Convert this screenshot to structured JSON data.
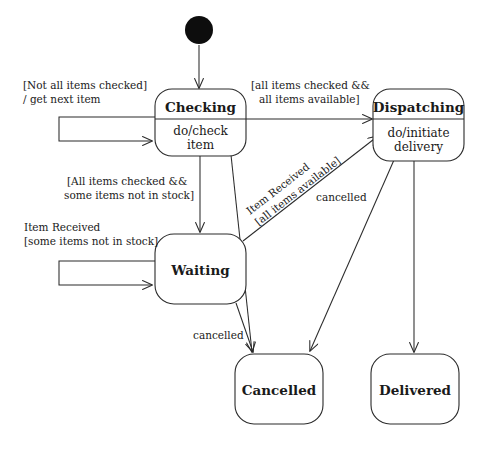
{
  "diagram": {
    "kind": "uml-state-machine-diagram",
    "canvas": {
      "width": 488,
      "height": 450
    },
    "states": {
      "initial": {
        "name": "initial-pseudostate",
        "label": ""
      },
      "checking": {
        "name": "Checking",
        "activity_line1": "do/check",
        "activity_line2": "item"
      },
      "dispatching": {
        "name": "Dispatching",
        "activity_line1": "do/initiate",
        "activity_line2": "delivery"
      },
      "waiting": {
        "name": "Waiting",
        "activity_line1": "",
        "activity_line2": ""
      },
      "cancelled": {
        "name": "Cancelled",
        "activity_line1": "",
        "activity_line2": ""
      },
      "delivered": {
        "name": "Delivered",
        "activity_line1": "",
        "activity_line2": ""
      }
    },
    "transitions": {
      "checking_self": {
        "line1": "[Not all items checked]",
        "line2": "/ get next item",
        "from": "Checking",
        "to": "Checking"
      },
      "checking_to_dispatching": {
        "line1": "[all items checked &&",
        "line2": "all items available]",
        "from": "Checking",
        "to": "Dispatching"
      },
      "checking_to_waiting": {
        "line1": "[All items checked &&",
        "line2": "some items not in stock]",
        "from": "Checking",
        "to": "Waiting"
      },
      "waiting_self": {
        "line1": "Item Received",
        "line2": "[some items not in stock]",
        "from": "Waiting",
        "to": "Waiting"
      },
      "waiting_to_dispatching": {
        "line1": "Item Received",
        "line2": "[all items available]",
        "from": "Waiting",
        "to": "Dispatching"
      },
      "dispatching_to_cancelled": {
        "line1": "cancelled",
        "from": "Dispatching",
        "to": "Cancelled"
      },
      "waiting_to_cancelled": {
        "line1": "cancelled",
        "from": "Waiting",
        "to": "Cancelled"
      },
      "checking_to_cancelled": {
        "line1": "",
        "from": "Checking",
        "to": "Cancelled"
      },
      "dispatching_to_delivered": {
        "line1": "",
        "from": "Dispatching",
        "to": "Delivered"
      },
      "initial_to_checking": {
        "line1": "",
        "from": "initial",
        "to": "Checking"
      }
    },
    "colors": {
      "stroke": "#2b2b2b",
      "fill": "#ffffff",
      "text": "#1a1a1a",
      "initial_dot": "#0d0d0d",
      "background": "#ffffff"
    }
  }
}
